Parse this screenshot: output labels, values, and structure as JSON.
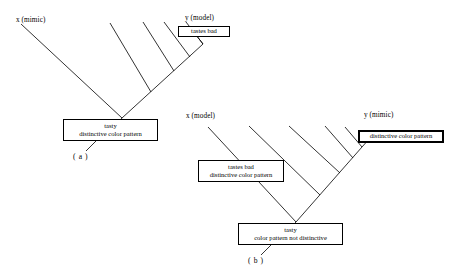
{
  "figure": {
    "title": "",
    "background_color": "#ffffff",
    "line_color": "#000000",
    "width": 454,
    "height": 280
  },
  "panels": [
    {
      "id": "a",
      "caption": "( a )",
      "taxa": [
        {
          "name": "x-mimic",
          "label": "x (mimic)"
        },
        {
          "name": "y-model",
          "label": "y (model)"
        }
      ],
      "boxes": [
        {
          "name": "tastes-bad-box",
          "lines": [
            "tastes bad"
          ],
          "border": "thin"
        },
        {
          "name": "root-state-box",
          "lines": [
            "tasty",
            "distinctive color pattern"
          ],
          "border": "thin"
        }
      ]
    },
    {
      "id": "b",
      "caption": "( b )",
      "taxa": [
        {
          "name": "x-model",
          "label": "x (model)"
        },
        {
          "name": "y-mimic",
          "label": "y (mimic)"
        }
      ],
      "boxes": [
        {
          "name": "tastes-bad-distinctive-box",
          "lines": [
            "tastes bad",
            "distinctive color pattern"
          ],
          "border": "thin"
        },
        {
          "name": "distinctive-color-pattern-box",
          "lines": [
            "distinctive color pattern"
          ],
          "border": "thick"
        },
        {
          "name": "root-state-box",
          "lines": [
            "tasty",
            "color pattern not distinctive"
          ],
          "border": "thin"
        }
      ]
    }
  ]
}
